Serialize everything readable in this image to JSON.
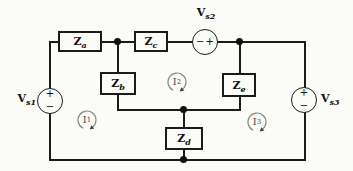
{
  "figure": {
    "type": "circuit-diagram",
    "background_color": "#fbfbf8",
    "line_color": "#1b1b1b",
    "mesh_arrow_color": "#8a8a8a"
  },
  "impedances": {
    "za": {
      "base": "Z",
      "sub": "a"
    },
    "zb": {
      "base": "Z",
      "sub": "b"
    },
    "zc": {
      "base": "Z",
      "sub": "c"
    },
    "zd": {
      "base": "Z",
      "sub": "d"
    },
    "ze": {
      "base": "Z",
      "sub": "e"
    }
  },
  "sources": {
    "vs1": {
      "base": "V",
      "sub": "s1",
      "top_sign": "+",
      "bottom_sign": "−"
    },
    "vs2": {
      "base": "V",
      "sub": "s2",
      "left_sign": "−",
      "right_sign": "+"
    },
    "vs3": {
      "base": "V",
      "sub": "s3",
      "top_sign": "+",
      "bottom_sign": "−"
    }
  },
  "mesh_currents": {
    "i1": {
      "base": "I",
      "sub": "1",
      "direction": "clockwise"
    },
    "i2": {
      "base": "I",
      "sub": "2",
      "direction": "clockwise"
    },
    "i3": {
      "base": "I",
      "sub": "3",
      "direction": "clockwise"
    }
  }
}
